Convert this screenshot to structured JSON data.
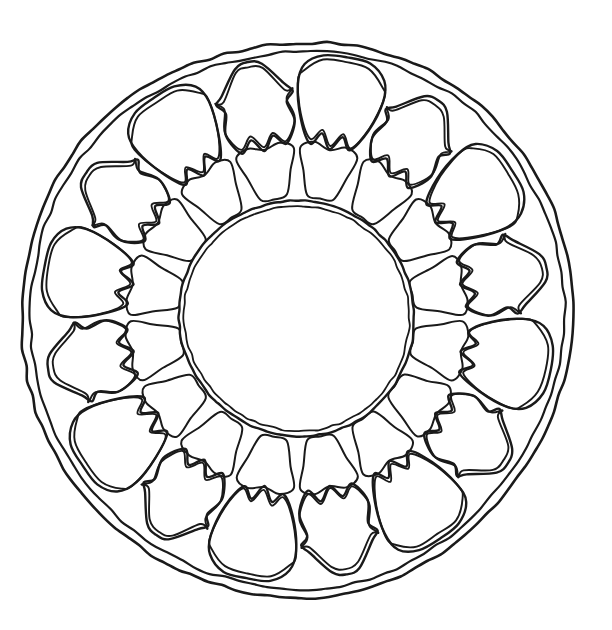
{
  "artwork": {
    "title": "Lotus Mandala Outline",
    "type": "line-drawing",
    "style": "hand-drawn ink contour, uncolored coloring-page",
    "background_color": "#ffffff",
    "stroke_color": "#1a1a1a",
    "canvas": {
      "width": 612,
      "height": 630
    }
  },
  "geometry": {
    "center": {
      "x": 297,
      "y": 318
    },
    "outer_border": {
      "name": "outer-rim",
      "description": "double concentric hand-drawn irregular circle forming the rim",
      "outer_radius_x": 273,
      "outer_radius_y": 281,
      "inner_offset": 9,
      "stroke_width": 2.6
    },
    "outer_petal_ring": {
      "name": "outer-petal-ring",
      "count": 16,
      "alternating": true,
      "radius_outer": 258,
      "radius_inner": 165,
      "bulbous_count": 8,
      "ogee_count": 8,
      "stroke_width": 2.4,
      "double_outline_offset": 5
    },
    "inner_petal_ring": {
      "name": "inner-petal-ring",
      "count": 16,
      "radius_outer": 172,
      "radius_inner": 118,
      "stroke_width": 2.0
    },
    "center_disc": {
      "name": "center-disc",
      "radius": 117,
      "inner_offset": 5,
      "stroke_width": 2.4
    }
  },
  "chart_data": {
    "type": "pie",
    "categories": [
      "outer-rim",
      "outer-petal-bulbous",
      "outer-petal-ogee",
      "inner-petal",
      "center-disc"
    ],
    "values": [
      1,
      8,
      8,
      16,
      1
    ],
    "xlabel": "",
    "ylabel": "",
    "legend": "none",
    "grid": false
  },
  "labels": {
    "outer_rim": "Outer rim",
    "outer_petal_ring": "Outer petal ring",
    "inner_petal_ring": "Inner petal ring",
    "center_disc": "Center disc"
  }
}
